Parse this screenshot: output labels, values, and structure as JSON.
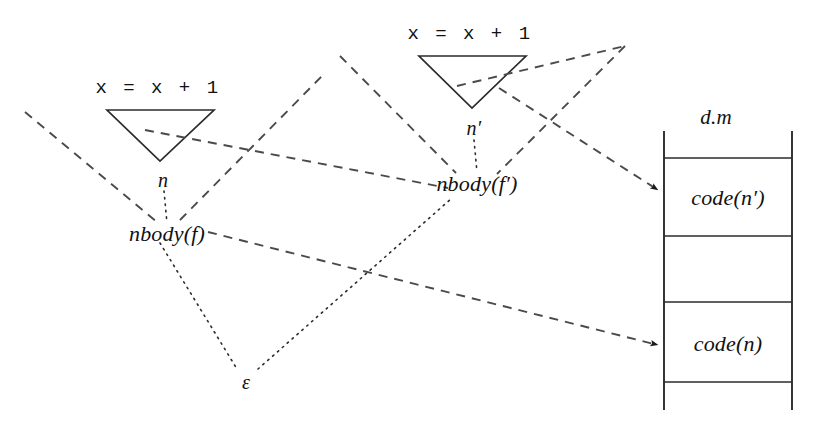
{
  "diagram": {
    "stroke_color": "#2b2b2b",
    "text_color": "#111111",
    "background": "#ffffff",
    "procedures": [
      {
        "id": "proc-left",
        "code_label": "x = x + 1",
        "node_label": "n",
        "function_label": "nbody(f)"
      },
      {
        "id": "proc-right",
        "code_label": "x = x + 1",
        "node_label": "n′",
        "function_label": "nbody(f′)"
      }
    ],
    "environment_label": "ε",
    "memory": {
      "title": "d.m",
      "cells": [
        {
          "label": "",
          "has_arrow": false
        },
        {
          "label": "code(n′)",
          "has_arrow": true
        },
        {
          "label": "",
          "has_arrow": false
        },
        {
          "label": "code(n)",
          "has_arrow": true
        },
        {
          "label": "",
          "has_arrow": false
        }
      ]
    }
  }
}
